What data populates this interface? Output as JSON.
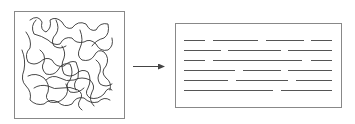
{
  "diagram": {
    "colors": {
      "stroke": "#333333",
      "box": "#888888",
      "lines": "#555555",
      "background": "#ffffff"
    },
    "left_panel": {
      "label": "",
      "box": {
        "x": 14,
        "y": 11,
        "w": 110,
        "h": 107
      }
    },
    "arrow": {
      "x1": 133,
      "y1": 66,
      "x2": 164,
      "y2": 66
    },
    "right_panel": {
      "label": "",
      "box": {
        "x": 175,
        "y": 23,
        "w": 166,
        "h": 84
      },
      "rows": [
        {
          "y": 40,
          "segments": [
            [
              184,
              205
            ],
            [
              213,
              258
            ],
            [
              266,
              304
            ],
            [
              311,
              332
            ]
          ]
        },
        {
          "y": 50,
          "segments": [
            [
              184,
              221
            ],
            [
              228,
              281
            ],
            [
              288,
              332
            ]
          ]
        },
        {
          "y": 60,
          "segments": [
            [
              184,
              205
            ],
            [
              213,
              302
            ],
            [
              311,
              332
            ]
          ]
        },
        {
          "y": 70,
          "segments": [
            [
              184,
              235
            ],
            [
              243,
              281
            ],
            [
              288,
              332
            ]
          ]
        },
        {
          "y": 80,
          "segments": [
            [
              184,
              228
            ],
            [
              236,
              288
            ],
            [
              296,
              332
            ]
          ]
        },
        {
          "y": 90,
          "segments": [
            [
              184,
              273
            ],
            [
              281,
              332
            ]
          ]
        }
      ]
    }
  }
}
